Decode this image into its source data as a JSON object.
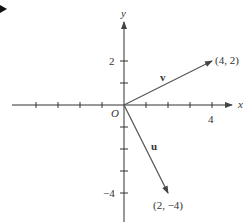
{
  "diagram": {
    "title_marker": "triangle-bullet",
    "axes": {
      "x_label": "x",
      "y_label": "y",
      "origin_label": "O",
      "x_tick_label": "4",
      "y_tick_pos_label": "2",
      "y_tick_neg_label": "−4"
    },
    "vectors": [
      {
        "name": "v",
        "label": "v",
        "end_label": "(4, 2)",
        "x": 4,
        "y": 2
      },
      {
        "name": "u",
        "label": "u",
        "end_label": "(2, −4)",
        "x": 2,
        "y": -4
      }
    ],
    "colors": {
      "axis": "#333333",
      "vector": "#555555"
    }
  }
}
